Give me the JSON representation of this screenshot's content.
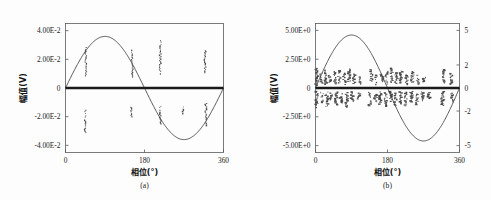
{
  "figure": {
    "background": "#fdfdfd",
    "curve_color": "#3a3a3a",
    "zero_line_color": "#1a1a1a",
    "scatter_color": "#4a4a4a",
    "frame_color": "#5a5a5a"
  },
  "panels": [
    {
      "id": "a",
      "caption": "(a)",
      "xlabel": "相位(°)",
      "ylabel": "幅值(V)",
      "x_ticks": [
        "0",
        "180",
        "360"
      ],
      "x_tick_values": [
        0,
        180,
        360
      ],
      "y_ticks": [
        "4.00E-2",
        "2.00E-2",
        "0",
        "-2.00E-2",
        "-4.00E-2"
      ],
      "y_tick_values": [
        0.04,
        0.02,
        0,
        -0.02,
        -0.04
      ]
    },
    {
      "id": "b",
      "caption": "(b)",
      "xlabel": "相位(°)",
      "ylabel": "幅值(V)",
      "x_ticks": [
        "0",
        "180",
        "360"
      ],
      "x_tick_values": [
        0,
        180,
        360
      ],
      "y_ticks": [
        "5.00E+0",
        "2.50E+0",
        "0",
        "-2.50E+0",
        "-5.00E+0"
      ],
      "y_tick_values": [
        5,
        2.5,
        0,
        -2.5,
        -5
      ],
      "y2_ticks": [
        "5",
        "2",
        "0",
        "-2",
        "-5"
      ],
      "y2_tick_values": [
        5,
        2,
        0,
        -2,
        -5
      ]
    }
  ],
  "chart_data": [
    {
      "type": "line",
      "panel": "a",
      "title": "",
      "xlabel": "相位(°)",
      "ylabel": "幅值(V)",
      "xlim": [
        0,
        360
      ],
      "ylim": [
        -0.045,
        0.045
      ],
      "grid": false,
      "legend": null,
      "series": [
        {
          "name": "sine-waveform",
          "kind": "line",
          "amplitude": 0.036,
          "period_deg": 360,
          "phase_deg": 0,
          "x": [
            0,
            10,
            20,
            30,
            40,
            50,
            60,
            70,
            80,
            90,
            100,
            110,
            120,
            130,
            140,
            150,
            160,
            170,
            180,
            190,
            200,
            210,
            220,
            230,
            240,
            250,
            260,
            270,
            280,
            290,
            300,
            310,
            320,
            330,
            340,
            350,
            360
          ],
          "y": [
            0.0,
            0.0063,
            0.0123,
            0.018,
            0.0231,
            0.0276,
            0.0312,
            0.0338,
            0.0355,
            0.036,
            0.0355,
            0.0338,
            0.0312,
            0.0276,
            0.0231,
            0.018,
            0.0123,
            0.0063,
            0.0,
            -0.0063,
            -0.0123,
            -0.018,
            -0.0231,
            -0.0276,
            -0.0312,
            -0.0338,
            -0.0355,
            -0.036,
            -0.0355,
            -0.0338,
            -0.0312,
            -0.0276,
            -0.0231,
            -0.018,
            -0.0123,
            -0.0063,
            0.0
          ]
        },
        {
          "name": "zero-reference-line",
          "kind": "hline",
          "y": 0
        },
        {
          "name": "scatter-clusters-positive",
          "kind": "scatter-vertical-clusters",
          "clusters": [
            {
              "x": 46,
              "y_min": 0.0085,
              "y_max": 0.0282,
              "n": 22
            },
            {
              "x": 152,
              "y_min": 0.0075,
              "y_max": 0.0262,
              "n": 24
            },
            {
              "x": 216,
              "y_min": 0.0098,
              "y_max": 0.033,
              "n": 26
            },
            {
              "x": 318,
              "y_min": 0.0105,
              "y_max": 0.0262,
              "n": 20
            }
          ]
        },
        {
          "name": "scatter-clusters-negative",
          "kind": "scatter-vertical-clusters",
          "clusters": [
            {
              "x": 45,
              "y_min": -0.0312,
              "y_max": -0.0148,
              "n": 22
            },
            {
              "x": 150,
              "y_min": -0.0215,
              "y_max": -0.0135,
              "n": 14
            },
            {
              "x": 216,
              "y_min": -0.025,
              "y_max": -0.0128,
              "n": 18
            },
            {
              "x": 268,
              "y_min": -0.018,
              "y_max": -0.0132,
              "n": 10
            },
            {
              "x": 320,
              "y_min": -0.0262,
              "y_max": -0.0108,
              "n": 26
            }
          ]
        }
      ]
    },
    {
      "type": "line",
      "panel": "b",
      "title": "",
      "xlabel": "相位(°)",
      "ylabel": "幅值(V)",
      "xlim": [
        0,
        360
      ],
      "ylim": [
        -5.6,
        5.6
      ],
      "y2lim": [
        -5.6,
        5.6
      ],
      "grid": false,
      "legend": null,
      "series": [
        {
          "name": "sine-waveform",
          "kind": "line",
          "amplitude": 4.6,
          "period_deg": 360,
          "phase_deg": 0,
          "x": [
            0,
            10,
            20,
            30,
            40,
            50,
            60,
            70,
            80,
            90,
            100,
            110,
            120,
            130,
            140,
            150,
            160,
            170,
            180,
            190,
            200,
            210,
            220,
            230,
            240,
            250,
            260,
            270,
            280,
            290,
            300,
            310,
            320,
            330,
            340,
            350,
            360
          ],
          "y": [
            0.0,
            0.8,
            1.57,
            2.3,
            2.96,
            3.52,
            3.98,
            4.32,
            4.53,
            4.6,
            4.53,
            4.32,
            3.98,
            3.52,
            2.96,
            2.3,
            1.57,
            0.8,
            0.0,
            -0.8,
            -1.57,
            -2.3,
            -2.96,
            -3.52,
            -3.98,
            -4.32,
            -4.53,
            -4.6,
            -4.53,
            -4.32,
            -3.98,
            -3.52,
            -2.96,
            -2.3,
            -1.57,
            -0.8,
            0.0
          ]
        },
        {
          "name": "zero-reference-line",
          "kind": "hline",
          "y": 0
        },
        {
          "name": "scatter-clusters-positive",
          "kind": "scatter-vertical-clusters",
          "clusters": [
            {
              "x": 3,
              "y_min": 0.25,
              "y_max": 1.7,
              "n": 16
            },
            {
              "x": 14,
              "y_min": 0.45,
              "y_max": 1.3,
              "n": 10
            },
            {
              "x": 26,
              "y_min": 0.3,
              "y_max": 1.55,
              "n": 18
            },
            {
              "x": 36,
              "y_min": 0.5,
              "y_max": 1.05,
              "n": 8
            },
            {
              "x": 48,
              "y_min": 0.35,
              "y_max": 1.4,
              "n": 14
            },
            {
              "x": 60,
              "y_min": 0.45,
              "y_max": 1.5,
              "n": 16
            },
            {
              "x": 72,
              "y_min": 0.3,
              "y_max": 1.25,
              "n": 12
            },
            {
              "x": 84,
              "y_min": 0.55,
              "y_max": 1.65,
              "n": 18
            },
            {
              "x": 96,
              "y_min": 0.4,
              "y_max": 1.2,
              "n": 10
            },
            {
              "x": 112,
              "y_min": 0.35,
              "y_max": 0.95,
              "n": 8
            },
            {
              "x": 140,
              "y_min": 0.45,
              "y_max": 1.6,
              "n": 16
            },
            {
              "x": 152,
              "y_min": 0.3,
              "y_max": 1.1,
              "n": 10
            },
            {
              "x": 166,
              "y_min": 0.55,
              "y_max": 1.25,
              "n": 12
            },
            {
              "x": 178,
              "y_min": 0.35,
              "y_max": 1.45,
              "n": 14
            },
            {
              "x": 190,
              "y_min": 0.5,
              "y_max": 1.7,
              "n": 18
            },
            {
              "x": 202,
              "y_min": 0.4,
              "y_max": 1.3,
              "n": 12
            },
            {
              "x": 214,
              "y_min": 0.45,
              "y_max": 1.55,
              "n": 16
            },
            {
              "x": 228,
              "y_min": 0.3,
              "y_max": 1.15,
              "n": 10
            },
            {
              "x": 242,
              "y_min": 0.5,
              "y_max": 1.4,
              "n": 14
            },
            {
              "x": 256,
              "y_min": 0.35,
              "y_max": 1.2,
              "n": 10
            },
            {
              "x": 272,
              "y_min": 0.4,
              "y_max": 0.9,
              "n": 8
            },
            {
              "x": 320,
              "y_min": 0.45,
              "y_max": 1.6,
              "n": 16
            },
            {
              "x": 340,
              "y_min": 0.35,
              "y_max": 1.25,
              "n": 12
            }
          ]
        },
        {
          "name": "scatter-clusters-negative",
          "kind": "scatter-vertical-clusters",
          "clusters": [
            {
              "x": 3,
              "y_min": -1.7,
              "y_max": -0.3,
              "n": 16
            },
            {
              "x": 16,
              "y_min": -1.25,
              "y_max": -0.4,
              "n": 10
            },
            {
              "x": 28,
              "y_min": -1.6,
              "y_max": -0.35,
              "n": 18
            },
            {
              "x": 40,
              "y_min": -1.0,
              "y_max": -0.45,
              "n": 8
            },
            {
              "x": 52,
              "y_min": -1.45,
              "y_max": -0.3,
              "n": 16
            },
            {
              "x": 64,
              "y_min": -1.3,
              "y_max": -0.5,
              "n": 12
            },
            {
              "x": 78,
              "y_min": -1.65,
              "y_max": -0.4,
              "n": 18
            },
            {
              "x": 92,
              "y_min": -1.15,
              "y_max": -0.35,
              "n": 10
            },
            {
              "x": 108,
              "y_min": -0.95,
              "y_max": -0.45,
              "n": 8
            },
            {
              "x": 136,
              "y_min": -1.55,
              "y_max": -0.3,
              "n": 16
            },
            {
              "x": 150,
              "y_min": -1.2,
              "y_max": -0.5,
              "n": 12
            },
            {
              "x": 162,
              "y_min": -1.4,
              "y_max": -0.35,
              "n": 14
            },
            {
              "x": 176,
              "y_min": -1.6,
              "y_max": -0.4,
              "n": 18
            },
            {
              "x": 188,
              "y_min": -1.25,
              "y_max": -0.3,
              "n": 12
            },
            {
              "x": 200,
              "y_min": -1.5,
              "y_max": -0.45,
              "n": 16
            },
            {
              "x": 212,
              "y_min": -1.35,
              "y_max": -0.35,
              "n": 14
            },
            {
              "x": 226,
              "y_min": -1.55,
              "y_max": -0.4,
              "n": 16
            },
            {
              "x": 240,
              "y_min": -1.2,
              "y_max": -0.3,
              "n": 12
            },
            {
              "x": 254,
              "y_min": -1.45,
              "y_max": -0.5,
              "n": 14
            },
            {
              "x": 268,
              "y_min": -1.1,
              "y_max": -0.35,
              "n": 10
            },
            {
              "x": 284,
              "y_min": -0.9,
              "y_max": -0.4,
              "n": 8
            },
            {
              "x": 318,
              "y_min": -1.5,
              "y_max": -0.3,
              "n": 16
            },
            {
              "x": 342,
              "y_min": -1.2,
              "y_max": -0.45,
              "n": 12
            }
          ]
        }
      ]
    }
  ]
}
